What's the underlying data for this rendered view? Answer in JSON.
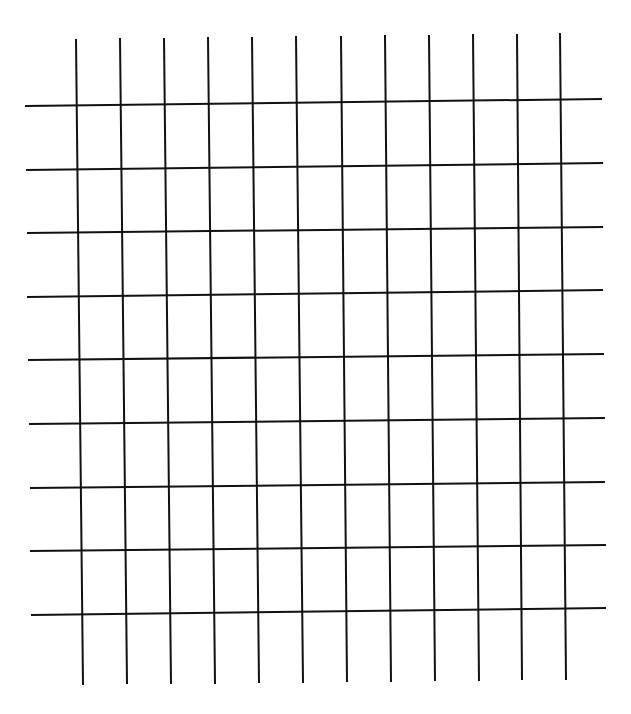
{
  "diagram": {
    "type": "grid",
    "line_color": "#111111",
    "background": "#ffffff",
    "stroke_width": 2,
    "vertical_lines": [
      {
        "x1": 76,
        "y1": 39,
        "x2": 83,
        "y2": 685
      },
      {
        "x1": 120,
        "y1": 38,
        "x2": 127,
        "y2": 684
      },
      {
        "x1": 164,
        "y1": 38,
        "x2": 171,
        "y2": 684
      },
      {
        "x1": 208,
        "y1": 37,
        "x2": 215,
        "y2": 684
      },
      {
        "x1": 252,
        "y1": 37,
        "x2": 259,
        "y2": 683
      },
      {
        "x1": 296,
        "y1": 36,
        "x2": 303,
        "y2": 683
      },
      {
        "x1": 341,
        "y1": 36,
        "x2": 347,
        "y2": 682
      },
      {
        "x1": 385,
        "y1": 35,
        "x2": 391,
        "y2": 682
      },
      {
        "x1": 429,
        "y1": 35,
        "x2": 435,
        "y2": 681
      },
      {
        "x1": 473,
        "y1": 34,
        "x2": 479,
        "y2": 681
      },
      {
        "x1": 517,
        "y1": 34,
        "x2": 522,
        "y2": 680
      },
      {
        "x1": 560,
        "y1": 33,
        "x2": 566,
        "y2": 680
      }
    ],
    "horizontal_lines": [
      {
        "x1": 25,
        "y1": 106,
        "x2": 602,
        "y2": 99
      },
      {
        "x1": 26,
        "y1": 170,
        "x2": 603,
        "y2": 163
      },
      {
        "x1": 27,
        "y1": 233,
        "x2": 603,
        "y2": 227
      },
      {
        "x1": 27,
        "y1": 297,
        "x2": 603,
        "y2": 290
      },
      {
        "x1": 28,
        "y1": 360,
        "x2": 604,
        "y2": 354
      },
      {
        "x1": 29,
        "y1": 424,
        "x2": 605,
        "y2": 418
      },
      {
        "x1": 30,
        "y1": 488,
        "x2": 605,
        "y2": 482
      },
      {
        "x1": 30,
        "y1": 551,
        "x2": 606,
        "y2": 545
      },
      {
        "x1": 31,
        "y1": 615,
        "x2": 606,
        "y2": 608
      }
    ]
  }
}
